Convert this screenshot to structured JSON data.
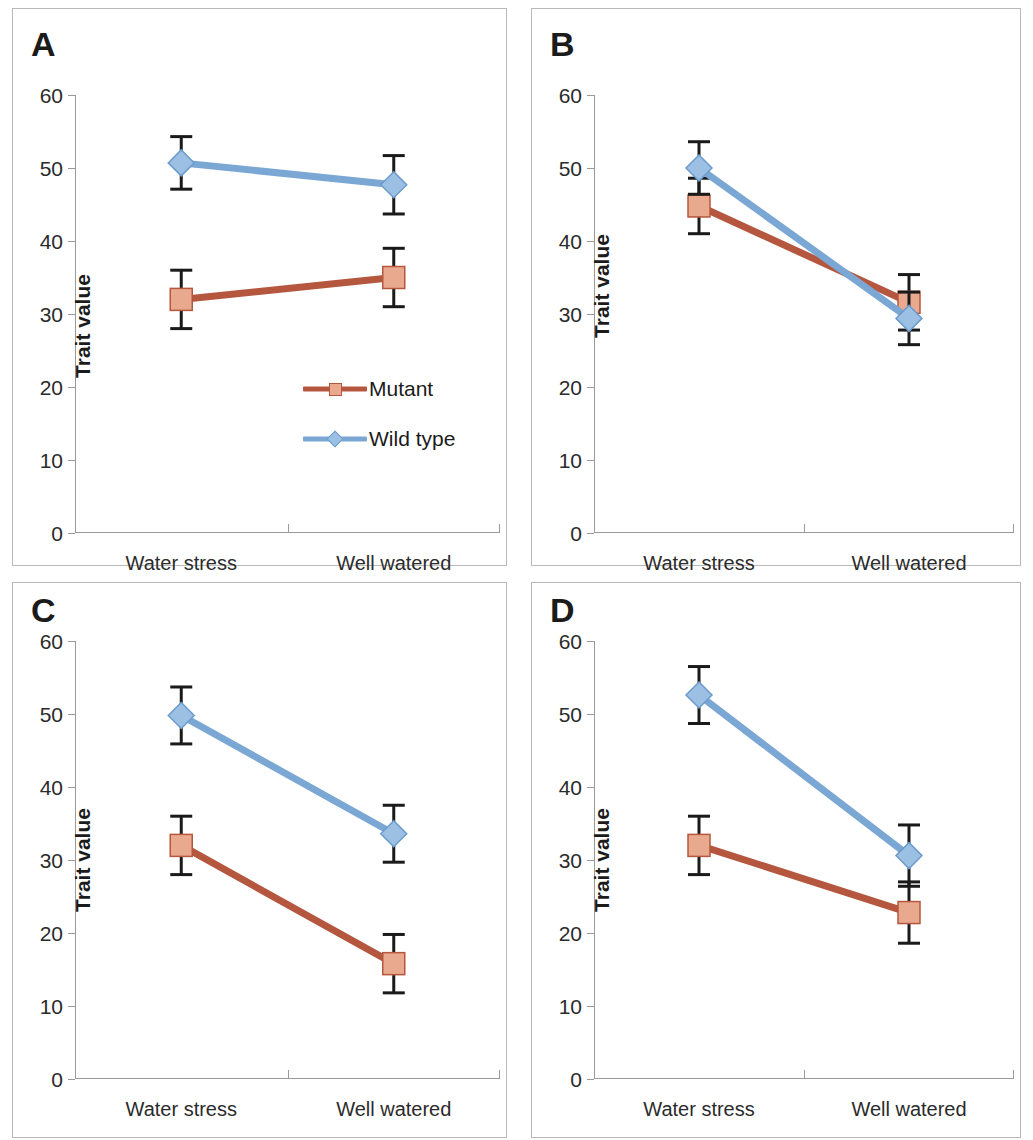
{
  "figure": {
    "background": "#ffffff",
    "panel_border_color": "#b9b9b9",
    "axis_color": "#9a9a9a"
  },
  "legend": {
    "position": "panel A, lower middle-right",
    "entries": [
      {
        "label": "Mutant",
        "marker": "square-marker",
        "color": "#b5573f",
        "marker_fill": "#e9a98e"
      },
      {
        "label": "Wild type",
        "marker": "diamond-marker",
        "color": "#7ba7d4",
        "marker_fill": "#9cc0e4"
      }
    ]
  },
  "chart_data": [
    {
      "type": "line",
      "panel": "A",
      "title": "A",
      "xlabel": "",
      "ylabel": "Trait value",
      "categories": [
        "Water stress",
        "Well watered"
      ],
      "yticks": [
        0,
        10,
        20,
        30,
        40,
        50,
        60
      ],
      "ylim": [
        0,
        60
      ],
      "grid": false,
      "legend_position": "inside lower-right",
      "series": [
        {
          "name": "Mutant",
          "color": "#b5573f",
          "marker": "square",
          "values": [
            32.0,
            35.0
          ],
          "errors": [
            4.0,
            4.0
          ]
        },
        {
          "name": "Wild type",
          "color": "#7ba7d4",
          "marker": "diamond",
          "values": [
            50.7,
            47.7
          ],
          "errors": [
            3.6,
            4.0
          ]
        }
      ]
    },
    {
      "type": "line",
      "panel": "B",
      "title": "B",
      "xlabel": "",
      "ylabel": "Trait value",
      "categories": [
        "Water stress",
        "Well watered"
      ],
      "yticks": [
        0,
        10,
        20,
        30,
        40,
        50,
        60
      ],
      "ylim": [
        0,
        60
      ],
      "grid": false,
      "legend_position": "none",
      "series": [
        {
          "name": "Mutant",
          "color": "#b5573f",
          "marker": "square",
          "values": [
            44.8,
            31.6
          ],
          "errors": [
            3.8,
            3.8
          ]
        },
        {
          "name": "Wild type",
          "color": "#7ba7d4",
          "marker": "diamond",
          "values": [
            50.0,
            29.4
          ],
          "errors": [
            3.6,
            3.6
          ]
        }
      ]
    },
    {
      "type": "line",
      "panel": "C",
      "title": "C",
      "xlabel": "",
      "ylabel": "Trait value",
      "categories": [
        "Water stress",
        "Well watered"
      ],
      "yticks": [
        0,
        10,
        20,
        30,
        40,
        50,
        60
      ],
      "ylim": [
        0,
        60
      ],
      "grid": false,
      "legend_position": "none",
      "series": [
        {
          "name": "Mutant",
          "color": "#b5573f",
          "marker": "square",
          "values": [
            32.0,
            15.8
          ],
          "errors": [
            4.0,
            4.0
          ]
        },
        {
          "name": "Wild type",
          "color": "#7ba7d4",
          "marker": "diamond",
          "values": [
            49.8,
            33.6
          ],
          "errors": [
            3.9,
            3.9
          ]
        }
      ]
    },
    {
      "type": "line",
      "panel": "D",
      "title": "D",
      "xlabel": "",
      "ylabel": "Trait value",
      "categories": [
        "Water stress",
        "Well watered"
      ],
      "yticks": [
        0,
        10,
        20,
        30,
        40,
        50,
        60
      ],
      "ylim": [
        0,
        60
      ],
      "grid": false,
      "legend_position": "none",
      "series": [
        {
          "name": "Mutant",
          "color": "#b5573f",
          "marker": "square",
          "values": [
            32.0,
            22.8
          ],
          "errors": [
            4.0,
            4.2
          ]
        },
        {
          "name": "Wild type",
          "color": "#7ba7d4",
          "marker": "diamond",
          "values": [
            52.6,
            30.6
          ],
          "errors": [
            3.9,
            4.2
          ]
        }
      ]
    }
  ]
}
